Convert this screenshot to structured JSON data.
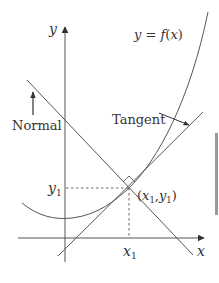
{
  "figure": {
    "curve_label": "y = f(x)",
    "axis_labels": {
      "x": "x",
      "y": "y"
    },
    "point_label": "(x1, y1)",
    "point_label_parts": {
      "open": "(",
      "x": "x",
      "x_sub": "1",
      "comma": ",",
      "y": "y",
      "y_sub": "1",
      "close": ")"
    },
    "x_tick_label": {
      "main": "x",
      "sub": "1"
    },
    "y_tick_label": {
      "main": "y",
      "sub": "1"
    },
    "annotations": {
      "tangent": "Tangent",
      "normal": "Normal"
    },
    "colors": {
      "line": "#444444",
      "text": "#333333",
      "edge_bar": "#9a9a9a"
    }
  }
}
